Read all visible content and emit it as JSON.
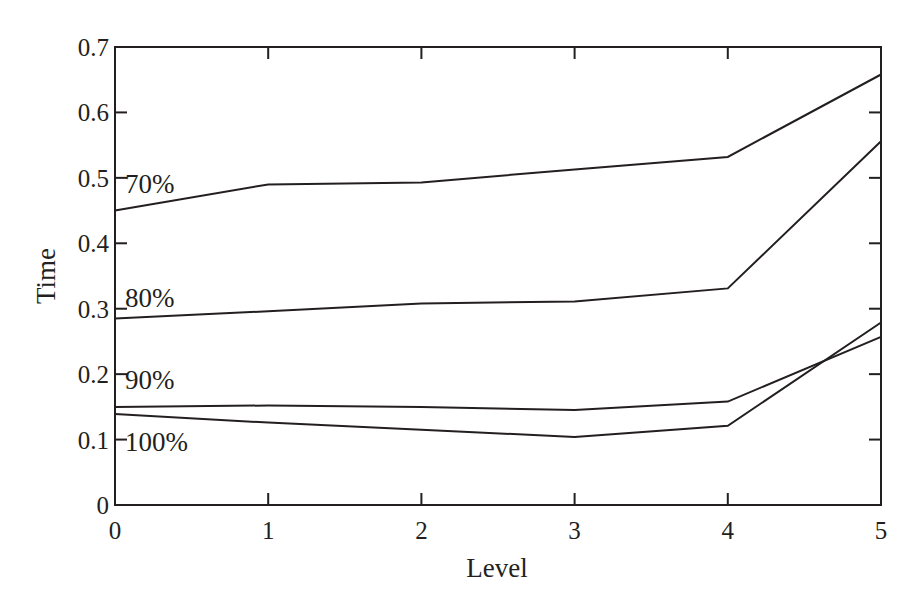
{
  "chart_data": {
    "type": "line",
    "title": "",
    "xlabel": "Level",
    "ylabel": "Time",
    "x": [
      0,
      1,
      2,
      3,
      4,
      5
    ],
    "xlim": [
      0,
      5
    ],
    "ylim": [
      0,
      0.7
    ],
    "x_ticks": [
      "0",
      "1",
      "2",
      "3",
      "4",
      "5"
    ],
    "y_ticks": [
      "0",
      "0.1",
      "0.2",
      "0.3",
      "0.4",
      "0.5",
      "0.6",
      "0.7"
    ],
    "grid": false,
    "legend": "inline labels at left of each line",
    "series": [
      {
        "name": "70%",
        "values": [
          0.45,
          0.49,
          0.493,
          0.513,
          0.532,
          0.658
        ]
      },
      {
        "name": "80%",
        "values": [
          0.285,
          0.296,
          0.308,
          0.311,
          0.331,
          0.556
        ]
      },
      {
        "name": "90%",
        "values": [
          0.15,
          0.152,
          0.15,
          0.145,
          0.158,
          0.257
        ]
      },
      {
        "name": "100%",
        "values": [
          0.139,
          0.126,
          0.115,
          0.104,
          0.121,
          0.279
        ]
      }
    ],
    "colors": {
      "line": "#231f20",
      "axis": "#231f20",
      "background": "#ffffff"
    }
  }
}
